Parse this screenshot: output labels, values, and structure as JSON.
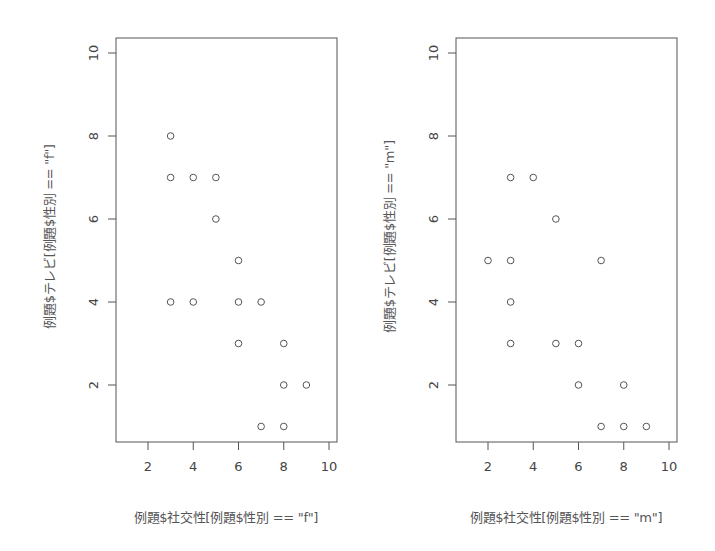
{
  "chart_data": [
    {
      "type": "scatter",
      "title": "",
      "xlabel": "例題$社交性[例題$性別 == \"f\"]",
      "ylabel": "例題$テレビ[例題$性別 == \"f\"]",
      "xlim": [
        0.6,
        10.3
      ],
      "ylim": [
        0.6,
        10.3
      ],
      "x_ticks": [
        2,
        4,
        6,
        8,
        10
      ],
      "y_ticks": [
        2,
        4,
        6,
        8,
        10
      ],
      "grid": false,
      "marker": "open-circle",
      "points": [
        {
          "x": 3,
          "y": 8
        },
        {
          "x": 3,
          "y": 7
        },
        {
          "x": 4,
          "y": 7
        },
        {
          "x": 5,
          "y": 7
        },
        {
          "x": 5,
          "y": 6
        },
        {
          "x": 6,
          "y": 5
        },
        {
          "x": 3,
          "y": 4
        },
        {
          "x": 4,
          "y": 4
        },
        {
          "x": 6,
          "y": 4
        },
        {
          "x": 7,
          "y": 4
        },
        {
          "x": 6,
          "y": 3
        },
        {
          "x": 8,
          "y": 3
        },
        {
          "x": 8,
          "y": 2
        },
        {
          "x": 9,
          "y": 2
        },
        {
          "x": 7,
          "y": 1
        },
        {
          "x": 8,
          "y": 1
        }
      ]
    },
    {
      "type": "scatter",
      "title": "",
      "xlabel": "例題$社交性[例題$性別 == \"m\"]",
      "ylabel": "例題$テレビ[例題$性別 == \"m\"]",
      "xlim": [
        0.6,
        10.3
      ],
      "ylim": [
        0.6,
        10.3
      ],
      "x_ticks": [
        2,
        4,
        6,
        8,
        10
      ],
      "y_ticks": [
        2,
        4,
        6,
        8,
        10
      ],
      "grid": false,
      "marker": "open-circle",
      "points": [
        {
          "x": 3,
          "y": 7
        },
        {
          "x": 4,
          "y": 7
        },
        {
          "x": 5,
          "y": 6
        },
        {
          "x": 2,
          "y": 5
        },
        {
          "x": 3,
          "y": 5
        },
        {
          "x": 7,
          "y": 5
        },
        {
          "x": 3,
          "y": 4
        },
        {
          "x": 3,
          "y": 3
        },
        {
          "x": 5,
          "y": 3
        },
        {
          "x": 6,
          "y": 3
        },
        {
          "x": 6,
          "y": 2
        },
        {
          "x": 8,
          "y": 2
        },
        {
          "x": 7,
          "y": 1
        },
        {
          "x": 8,
          "y": 1
        },
        {
          "x": 9,
          "y": 1
        }
      ]
    }
  ],
  "plots": [
    {
      "xlabel": "例題$社交性[例題$性別 == \"f\"]",
      "ylabel": "例題$テレビ[例題$性別 == \"f\"]"
    },
    {
      "xlabel": "例題$社交性[例題$性別 == \"m\"]",
      "ylabel": "例題$テレビ[例題$性別 == \"m\"]"
    }
  ],
  "style": {
    "axis_color": "#555555",
    "point_color": "#555555",
    "background": "#ffffff"
  }
}
